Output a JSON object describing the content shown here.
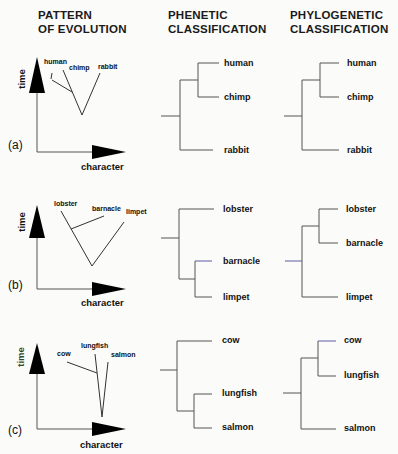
{
  "headers": {
    "pattern": [
      "PATTERN",
      "OF EVOLUTION"
    ],
    "phenetic": [
      "PHENETIC",
      "CLASSIFICATION"
    ],
    "phylogenetic": [
      "PHYLOGENETIC",
      "CLASSIFICATION"
    ]
  },
  "axes": {
    "y_label": "time",
    "x_label": "character"
  },
  "panels": [
    {
      "id": "(a)",
      "evolution_taxa": [
        "human",
        "chimp",
        "rabbit"
      ],
      "phenetic": {
        "taxa": [
          "human",
          "chimp",
          "rabbit"
        ],
        "grouping": "((human, chimp), rabbit)"
      },
      "phylogenetic": {
        "taxa": [
          "human",
          "chimp",
          "rabbit"
        ],
        "grouping": "((human, chimp), rabbit)"
      }
    },
    {
      "id": "(b)",
      "evolution_taxa": [
        "lobster",
        "barnacle",
        "limpet"
      ],
      "phenetic": {
        "taxa": [
          "lobster",
          "barnacle",
          "limpet"
        ],
        "grouping": "(lobster, (barnacle, limpet))"
      },
      "phylogenetic": {
        "taxa": [
          "lobster",
          "barnacle",
          "limpet"
        ],
        "grouping": "((lobster, barnacle), limpet)"
      }
    },
    {
      "id": "(c)",
      "evolution_taxa": [
        "cow",
        "lungfish",
        "salmon"
      ],
      "phenetic": {
        "taxa": [
          "cow",
          "lungfish",
          "salmon"
        ],
        "grouping": "(cow, (lungfish, salmon))"
      },
      "phylogenetic": {
        "taxa": [
          "cow",
          "lungfish",
          "salmon"
        ],
        "grouping": "((cow, lungfish), salmon)"
      }
    }
  ],
  "colors": {
    "line": "#555555",
    "text": "#111111",
    "arrow": "#000000",
    "time_label_c": "#2d4a2d",
    "highlight_line": "#5a5aa0"
  }
}
